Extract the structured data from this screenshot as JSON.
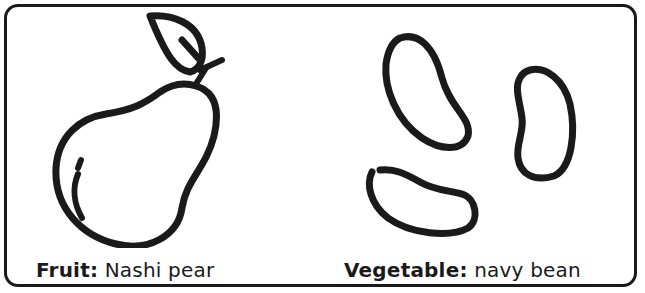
{
  "card": {
    "items": [
      {
        "icon": "pear-icon",
        "category_label": "Fruit:",
        "name": "Nashi pear"
      },
      {
        "icon": "navy-bean-icon",
        "category_label": "Vegetable:",
        "name": "navy bean"
      }
    ]
  },
  "colors": {
    "stroke": "#1a1a1a",
    "background": "#ffffff"
  }
}
